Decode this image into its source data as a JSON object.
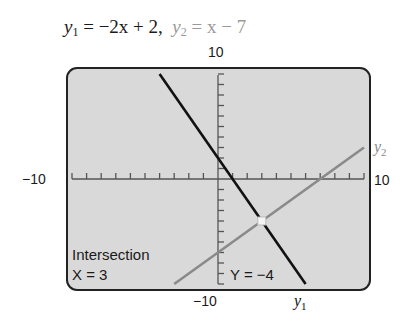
{
  "title": {
    "eq1_lhs": "y",
    "eq1_sub": "1",
    "eq1_rhs": " = −2x + 2,",
    "eq2_lhs": "y",
    "eq2_sub": "2",
    "eq2_rhs": " = x − 7"
  },
  "axis_labels": {
    "ymax": "10",
    "ymin": "−10",
    "xmin": "−10",
    "xmax": "10"
  },
  "curve_labels": {
    "y1": "y",
    "y1_sub": "1",
    "y2": "y",
    "y2_sub": "2"
  },
  "screen_text": {
    "intersection": "Intersection",
    "x_value": "X = 3",
    "y_value": "Y = −4"
  },
  "colors": {
    "screen_bg": "#d9d9d9",
    "y1_line": "#111111",
    "y2_line": "#8a8a8a",
    "frame": "#222222"
  },
  "chart_data": {
    "type": "line",
    "xlim": [
      -10,
      10
    ],
    "ylim": [
      -10,
      10
    ],
    "xscale_ticks": 1,
    "yscale_ticks": 1,
    "series": [
      {
        "name": "y1",
        "equation": "y = -2x + 2",
        "x": [
          -4,
          6
        ],
        "y": [
          10,
          -10
        ]
      },
      {
        "name": "y2",
        "equation": "y = x - 7",
        "x": [
          -3,
          10
        ],
        "y": [
          -10,
          3
        ]
      }
    ],
    "annotations": [
      {
        "type": "intersection",
        "x": 3,
        "y": -4,
        "text": "Intersection X = 3 Y = −4"
      }
    ],
    "grid": false,
    "legend": "none"
  }
}
